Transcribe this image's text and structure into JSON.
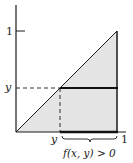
{
  "diagram": {
    "colors": {
      "line": "#1a1a1a",
      "fill": "#e4e4e4",
      "background": "#ffffff"
    },
    "labels": {
      "y_axis_tick_one": "1",
      "y_axis_y": "y",
      "x_axis_y": "y",
      "x_axis_one": "1",
      "brace_caption": "f(x, y) > 0"
    },
    "shapes": {
      "triangle_vertices": [
        [
          0,
          0
        ],
        [
          1,
          0
        ],
        [
          1,
          1
        ]
      ],
      "horizontal_segment": {
        "y": "y",
        "x_from": "y",
        "x_to": 1
      },
      "dashed_guides": [
        "horizontal from axis to (y,y)",
        "vertical from (y,y) to (y,0)"
      ],
      "brace": {
        "x_from": "y",
        "x_to": 1
      }
    }
  }
}
